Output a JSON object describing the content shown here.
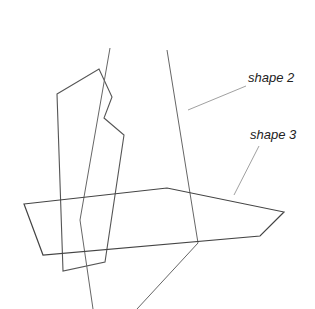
{
  "diagram": {
    "stroke_color": "#555555",
    "leader_color": "#888888",
    "shapes": [
      {
        "name": "shape 1",
        "points": "57,94 99,69 112,97 104,118 124,135 105,262 63,271"
      },
      {
        "name": "shape 2",
        "lines": [
          "110,48 80,220 93,309",
          "167,50 198,243 137,309"
        ]
      },
      {
        "name": "shape 3",
        "points": "24,204 167,188 284,212 260,236 43,255"
      }
    ],
    "labels": [
      {
        "text": "shape 2",
        "x": 248,
        "y": 82,
        "leader": "246,86 188,110"
      },
      {
        "text": "shape 3",
        "x": 250,
        "y": 139,
        "leader": "259,146 234,195"
      }
    ]
  }
}
